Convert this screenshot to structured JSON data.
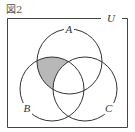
{
  "figure": {
    "title": "図2",
    "universe_label": "U",
    "sets": [
      {
        "label": "A",
        "cx": 69.5,
        "cy": 61.5,
        "r": 32.5
      },
      {
        "label": "B",
        "cx": 52,
        "cy": 89,
        "r": 32
      },
      {
        "label": "C",
        "cx": 85,
        "cy": 89,
        "r": 32
      }
    ],
    "shaded_region": "A ∩ B ∩ C̄",
    "colors": {
      "stroke": "#333333",
      "shade": "#b8b8b8",
      "frame": "#444444"
    }
  }
}
